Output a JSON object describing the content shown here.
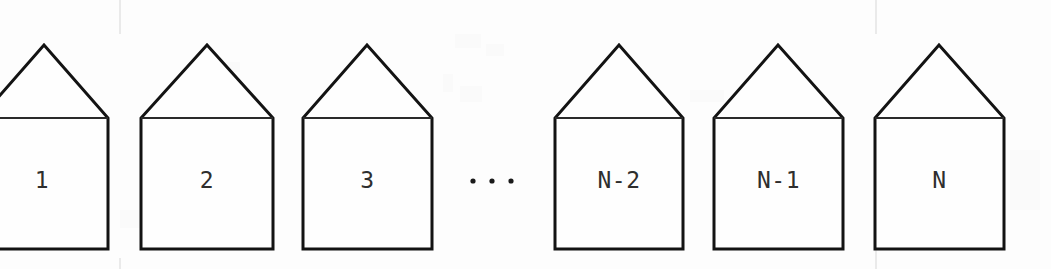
{
  "figure": {
    "kind": "houses-sequence-diagram",
    "background_color": "#fdfdfd",
    "stroke_color": "#131313",
    "label_color": "#2e2e2e",
    "canvas": {
      "width": 1051,
      "height": 269
    }
  },
  "geometry": {
    "eave_y": 118,
    "apex_y": 45,
    "base_y": 249,
    "stroke_width": 3,
    "label_y": 181
  },
  "houses": [
    {
      "id": "house-1",
      "label": "1",
      "left": -20,
      "right": 108,
      "apex_x": 44,
      "clipped": "left"
    },
    {
      "id": "house-2",
      "label": "2",
      "left": 141,
      "right": 273,
      "apex_x": 207,
      "clipped": "none"
    },
    {
      "id": "house-3",
      "label": "3",
      "left": 303,
      "right": 432,
      "apex_x": 367,
      "clipped": "none"
    },
    {
      "id": "house-n-minus-2",
      "label": "N-2",
      "left": 555,
      "right": 683,
      "apex_x": 619,
      "clipped": "none"
    },
    {
      "id": "house-n-minus-1",
      "label": "N-1",
      "left": 714,
      "right": 843,
      "apex_x": 778,
      "clipped": "none"
    },
    {
      "id": "house-n",
      "label": "N",
      "left": 875,
      "right": 1004,
      "apex_x": 939,
      "clipped": "none"
    }
  ],
  "ellipsis": {
    "text": "...",
    "dots": [
      473,
      492,
      511
    ],
    "y": 181,
    "radius": 2.6
  },
  "scan_artifacts": {
    "vertical_lines": [
      {
        "x": 120,
        "y1": 0,
        "y2": 34
      },
      {
        "x": 120,
        "y1": 258,
        "y2": 269
      },
      {
        "x": 876,
        "y1": 0,
        "y2": 34
      },
      {
        "x": 876,
        "y1": 247,
        "y2": 269
      }
    ]
  }
}
